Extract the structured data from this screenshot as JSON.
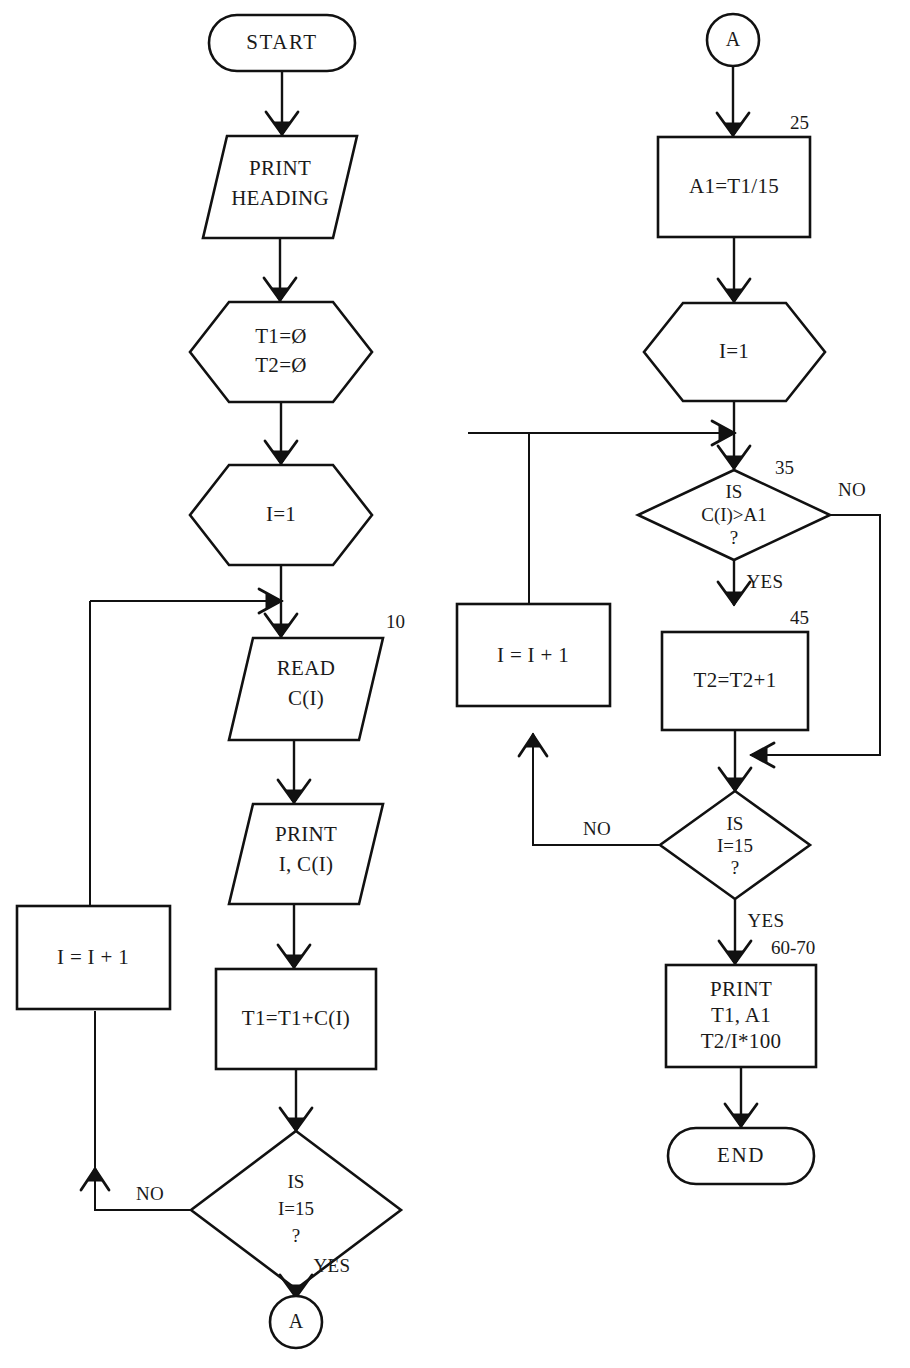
{
  "diagram": {
    "background_color": "#ffffff",
    "line_color": "#111111",
    "text_color": "#1a1a1a"
  },
  "left_column": {
    "start": {
      "label": "START",
      "shape": "terminator"
    },
    "print_heading": {
      "line1": "PRINT",
      "line2": "HEADING",
      "shape": "parallelogram"
    },
    "init_totals": {
      "line1": "T1=Ø",
      "line2": "T2=Ø",
      "shape": "hexagon"
    },
    "init_index": {
      "label": "I=1",
      "shape": "hexagon"
    },
    "read": {
      "line1": "READ",
      "line2": "C(I)",
      "shape": "parallelogram",
      "line_number": "10"
    },
    "print_values": {
      "line1": "PRINT",
      "line2": "I, C(I)",
      "shape": "parallelogram"
    },
    "accumulate": {
      "label": "T1=T1+C(I)",
      "shape": "rectangle"
    },
    "decision": {
      "line1": "IS",
      "line2": "I=15",
      "line3": "?",
      "shape": "diamond"
    },
    "increment": {
      "label": "I = I + 1",
      "shape": "rectangle"
    },
    "branch_no": "NO",
    "branch_yes": "YES",
    "connector_out": {
      "label": "A",
      "shape": "circle"
    }
  },
  "right_column": {
    "connector_in": {
      "label": "A",
      "shape": "circle"
    },
    "average": {
      "label": "A1=T1/15",
      "shape": "rectangle",
      "line_number": "25"
    },
    "init_index": {
      "label": "I=1",
      "shape": "hexagon"
    },
    "decision_compare": {
      "line1": "IS",
      "line2": "C(I)>A1",
      "line3": "?",
      "shape": "diamond",
      "line_number": "35"
    },
    "count": {
      "label": "T2=T2+1",
      "shape": "rectangle",
      "line_number": "45"
    },
    "increment": {
      "label": "I = I + 1",
      "shape": "rectangle"
    },
    "decision_loop": {
      "line1": "IS",
      "line2": "I=15",
      "line3": "?",
      "shape": "diamond"
    },
    "print_results": {
      "line1": "PRINT",
      "line2": "T1, A1",
      "line3": "T2/I*100",
      "shape": "rectangle",
      "line_number": "60-70"
    },
    "end": {
      "label": "END",
      "shape": "terminator"
    },
    "branch_no_compare": "NO",
    "branch_yes_compare": "YES",
    "branch_no_loop": "NO",
    "branch_yes_loop": "YES"
  }
}
